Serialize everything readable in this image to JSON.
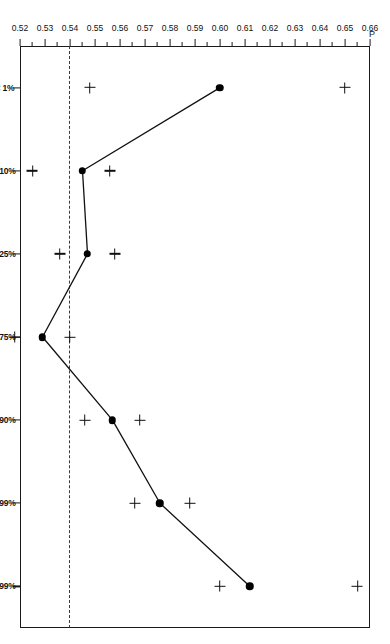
{
  "chart_data": {
    "type": "line",
    "title": "",
    "xlabel": "Class",
    "ylabel": "P",
    "categories": [
      "< 1%",
      "<10%",
      "<25%",
      "<75%",
      "<90%",
      "<99%",
      ">99%"
    ],
    "values": [
      0.6,
      0.545,
      0.547,
      0.529,
      0.557,
      0.576,
      0.612
    ],
    "series": [
      {
        "name": "P",
        "marker": "filled-circle",
        "values": [
          0.6,
          0.545,
          0.547,
          0.529,
          0.557,
          0.576,
          0.612
        ]
      },
      {
        "name": "upper-bound",
        "marker": "plus",
        "values": [
          0.65,
          0.556,
          0.558,
          0.54,
          0.568,
          0.588,
          0.655
        ]
      },
      {
        "name": "lower-bound",
        "marker": "plus",
        "values": [
          0.548,
          0.525,
          0.536,
          0.518,
          0.546,
          0.566,
          0.6
        ]
      }
    ],
    "reference_line": {
      "value": 0.54,
      "style": "dashed",
      "orientation": "horizontal"
    },
    "ylim": [
      0.52,
      0.66
    ],
    "xlim_categories": 7,
    "ytick_labels": [
      "0.66",
      "0.65",
      "0.64",
      "0.63",
      "0.62",
      "0.61",
      "0.60",
      "0.59",
      "0.58",
      "0.57",
      "0.56",
      "0.55",
      "0.54",
      "0.53",
      "0.52"
    ],
    "ytick_values": [
      0.66,
      0.65,
      0.64,
      0.63,
      0.62,
      0.61,
      0.6,
      0.59,
      0.58,
      0.57,
      0.56,
      0.55,
      0.54,
      0.53,
      0.52
    ],
    "grid": false,
    "legend": null,
    "y_axis_direction": "descending",
    "rotation_degrees": 90,
    "colors": {
      "line": "#111111",
      "marker": "#000000",
      "reference": "#3a3a3a",
      "axis": "#1a1a1a",
      "background": "#ffffff"
    }
  }
}
